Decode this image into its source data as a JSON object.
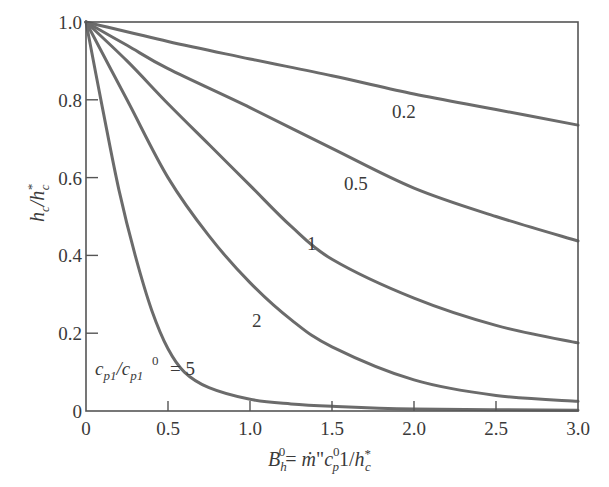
{
  "chart_data": {
    "type": "line",
    "title": "",
    "xlabel": "B_h^0 = ṁ\"c_p1^0/h_c^*",
    "ylabel": "h_c/h_c^*",
    "xlim": [
      0,
      3.0
    ],
    "ylim": [
      0,
      1.0
    ],
    "grid": false,
    "legend_position": "inline-labels",
    "x_ticks": [
      "0",
      "0.5",
      "1.0",
      "1.5",
      "2.0",
      "2.5",
      "3.0"
    ],
    "x_tick_values": [
      0,
      0.5,
      1.0,
      1.5,
      2.0,
      2.5,
      3.0
    ],
    "y_ticks": [
      "0",
      "0.2",
      "0.4",
      "0.6",
      "0.8",
      "1.0"
    ],
    "y_tick_values": [
      0,
      0.2,
      0.4,
      0.6,
      0.8,
      1.0
    ],
    "parameter_label": "c_p1/c_p1^0",
    "series": [
      {
        "name": "0.2",
        "label_pos": [
          1.62,
          0.79
        ],
        "x": [
          0,
          0.5,
          1.0,
          1.5,
          2.0,
          2.5,
          3.0
        ],
        "y": [
          1.0,
          0.95,
          0.905,
          0.862,
          0.815,
          0.775,
          0.735
        ]
      },
      {
        "name": "0.5",
        "label_pos": [
          1.33,
          0.595
        ],
        "x": [
          0,
          0.25,
          0.5,
          1.0,
          1.5,
          2.0,
          2.5,
          3.0
        ],
        "y": [
          1.0,
          0.94,
          0.88,
          0.78,
          0.675,
          0.573,
          0.5,
          0.437
        ]
      },
      {
        "name": "1",
        "label_pos": [
          1.38,
          0.44
        ],
        "x": [
          0,
          0.25,
          0.5,
          0.75,
          1.0,
          1.25,
          1.5,
          2.0,
          2.5,
          3.0
        ],
        "y": [
          1.0,
          0.9,
          0.79,
          0.685,
          0.58,
          0.475,
          0.39,
          0.29,
          0.22,
          0.175
        ]
      },
      {
        "name": "2",
        "label_pos": [
          0.88,
          0.22
        ],
        "x": [
          0,
          0.25,
          0.5,
          0.75,
          1.0,
          1.25,
          1.5,
          2.0,
          2.5,
          3.0
        ],
        "y": [
          1.0,
          0.8,
          0.6,
          0.45,
          0.33,
          0.235,
          0.165,
          0.08,
          0.04,
          0.025
        ]
      },
      {
        "name": "5",
        "label_pos": [
          0.05,
          0.16
        ],
        "x": [
          0,
          0.1,
          0.2,
          0.3,
          0.4,
          0.5,
          0.6,
          0.75,
          1.0,
          1.25,
          1.5,
          2.0,
          3.0
        ],
        "y": [
          1.0,
          0.78,
          0.57,
          0.4,
          0.26,
          0.16,
          0.1,
          0.06,
          0.03,
          0.018,
          0.012,
          0.005,
          0.002
        ]
      }
    ]
  },
  "labels": {
    "curve_0_2": "0.2",
    "curve_0_5": "0.5",
    "curve_1": "1",
    "curve_2": "2",
    "curve_5_value": "= 5"
  }
}
